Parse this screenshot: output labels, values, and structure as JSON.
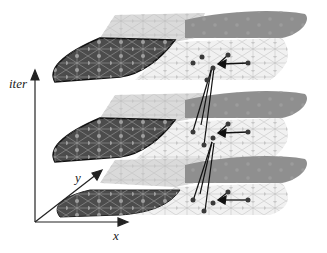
{
  "axes": {
    "vertical_label": "iter",
    "x_label": "x",
    "y_label": "y"
  },
  "layers": [
    {
      "name": "top",
      "offset_y": 0
    },
    {
      "name": "middle",
      "offset_y": 80
    },
    {
      "name": "bottom",
      "offset_y": 160
    }
  ],
  "colors": {
    "dark_region": "#4a4a4a",
    "gray_region": "#8c8c8c",
    "light_region": "#d8d8d8",
    "white_region": "#f2f2f2",
    "mesh_line": "#b8b8b8",
    "node": "#a8a8a8",
    "dark_node": "#3a3a3a",
    "axis": "#222222"
  }
}
